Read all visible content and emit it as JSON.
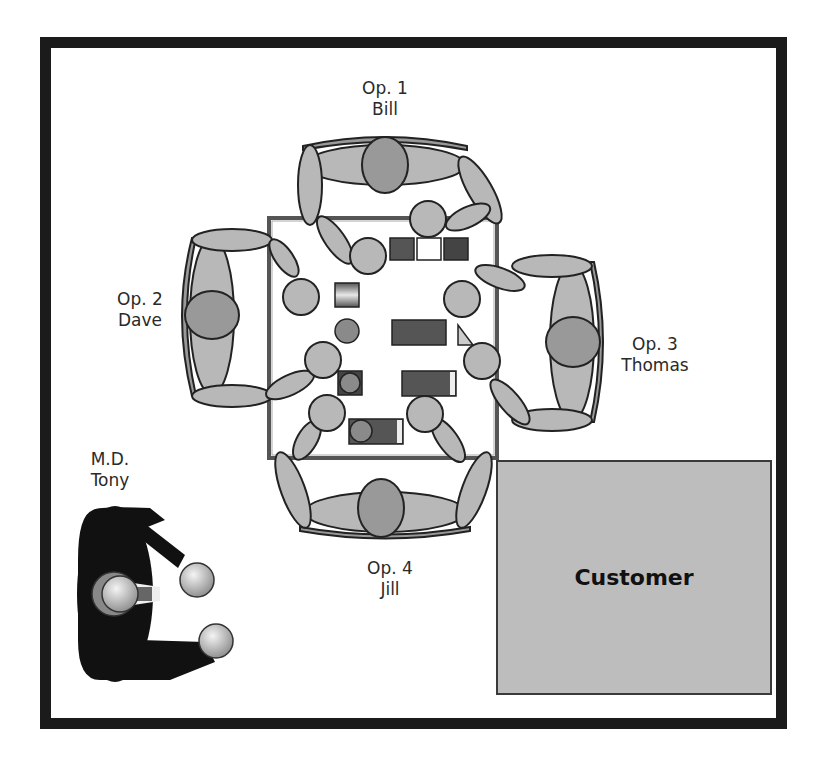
{
  "diagram": {
    "title": "",
    "customer": {
      "label": "Customer",
      "fill": "#bdbdbd"
    },
    "operators": [
      {
        "role": "Op. 1",
        "name": "Bill",
        "position": "top"
      },
      {
        "role": "Op. 2",
        "name": "Dave",
        "position": "left"
      },
      {
        "role": "Op. 3",
        "name": "Thomas",
        "position": "right"
      },
      {
        "role": "Op. 4",
        "name": "Jill",
        "position": "bottom"
      }
    ],
    "manager": {
      "role": "M.D.",
      "name": "Tony",
      "fill": "#111111"
    },
    "table": {
      "label": "",
      "items": [
        "dark-square",
        "white-square",
        "dark-square",
        "gradient-square",
        "small-circle",
        "dark-rect",
        "triangle",
        "circle-in-square",
        "dark-rect-with-bar",
        "circle-with-rect"
      ]
    },
    "colors": {
      "frame": "#1b1b1b",
      "person_fill": "#b8b8b8",
      "head_fill": "#9a9a9a",
      "object_dark": "#4a4a4a",
      "table_border": "#555555"
    }
  }
}
